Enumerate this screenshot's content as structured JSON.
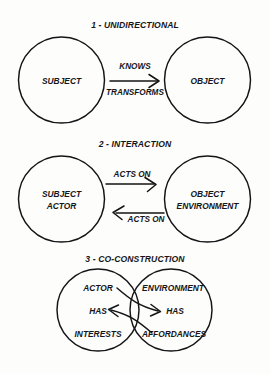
{
  "figure": {
    "background_color": "#fdfdfb",
    "ink_color": "#141417",
    "panel_count": 3
  },
  "panels": [
    {
      "id": "panel-unidirectional",
      "title": "1 - UNIDIRECTIONAL",
      "left_node": "SUBJECT",
      "right_node": "OBJECT",
      "edge_label_top": "KNOWS",
      "edge_label_bottom": "TRANSFORMS",
      "arrow_direction": "right"
    },
    {
      "id": "panel-interaction",
      "title": "2 - INTERACTION",
      "left_node_line1": "SUBJECT",
      "left_node_line2": "ACTOR",
      "right_node_line1": "OBJECT",
      "right_node_line2": "ENVIRONMENT",
      "edge_label_top": "ACTS ON",
      "edge_label_bottom": "ACTS ON",
      "arrow_direction_top": "right",
      "arrow_direction_bottom": "left"
    },
    {
      "id": "panel-co-construction",
      "title": "3 - CO-CONSTRUCTION",
      "left_node_line1": "ACTOR",
      "left_node_line2": "HAS",
      "left_node_line3": "INTERESTS",
      "right_node_line1": "ENVIRONMENT",
      "right_node_line2": "HAS",
      "right_node_line3": "AFFORDANCES",
      "arrow_direction": "bidirectional"
    }
  ]
}
